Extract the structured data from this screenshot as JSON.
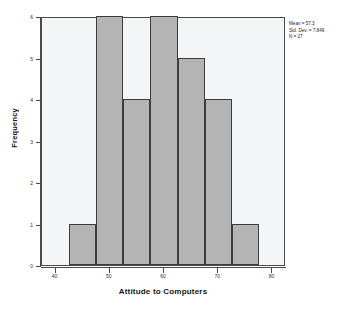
{
  "chart_data": {
    "type": "bar",
    "subtype": "histogram",
    "title": "",
    "xlabel": "Attitude to Computers",
    "ylabel": "Frequency",
    "xlim": [
      37.5,
      82.5
    ],
    "ylim": [
      0,
      6
    ],
    "grid": false,
    "legend": "none",
    "bin_width": 5,
    "bin_edges": [
      42.5,
      47.5,
      52.5,
      57.5,
      62.5,
      67.5,
      72.5,
      77.5
    ],
    "categories": [
      "42.5-47.5",
      "47.5-52.5",
      "52.5-57.5",
      "57.5-62.5",
      "62.5-67.5",
      "67.5-72.5",
      "72.5-77.5"
    ],
    "bin_centers": [
      45,
      50,
      55,
      60,
      65,
      70,
      75
    ],
    "values": [
      1,
      6,
      4,
      6,
      5,
      4,
      1
    ],
    "x_ticks": [
      40,
      50,
      60,
      70,
      80
    ],
    "x_tick_labels": [
      "40",
      "50",
      "60",
      "70",
      "80"
    ],
    "y_ticks": [
      0,
      1,
      2,
      3,
      4,
      5,
      6
    ],
    "y_tick_labels": [
      "0",
      "1",
      "2",
      "3",
      "4",
      "5",
      "6"
    ],
    "annotations": {
      "mean_label": "Mean = 57.3",
      "std_dev_label": "Std. Dev. = 7.849",
      "n_label": "N = 27"
    },
    "colors": {
      "bar_fill": "#b4b4b4",
      "bar_border": "#3d3d3d",
      "panel_background": "#f4f5f7",
      "frame_border": "#4a4a4a",
      "text": "#151515"
    }
  }
}
